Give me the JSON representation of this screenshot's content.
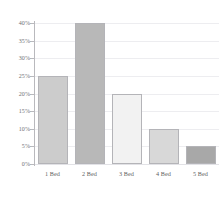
{
  "chart_data": {
    "type": "bar",
    "title": "",
    "subtitle": "",
    "xlabel": "",
    "ylabel": "",
    "categories": [
      "1 Bed",
      "2 Bed",
      "3 Bed",
      "4 Bed",
      "5 Bed"
    ],
    "values": [
      25,
      40,
      20,
      10,
      5
    ],
    "value_unit": "%",
    "ylim": [
      0,
      40
    ],
    "ytick_values": [
      0,
      5,
      10,
      15,
      20,
      25,
      30,
      35,
      40
    ],
    "ytick_labels": [
      "0%",
      "5%",
      "10%",
      "15%",
      "20%",
      "25%",
      "30%",
      "35%",
      "40%"
    ],
    "grid": true,
    "grid_axis": "y",
    "legend": false,
    "legend_position": "none",
    "bar_colors": [
      "#cccccc",
      "#b8b8b8",
      "#f2f2f2",
      "#d8d8d8",
      "#a8a8a8"
    ],
    "bar_border_color": "#b4b4b8",
    "gridline_color": "#ededf0",
    "axis_color": "#b9b9bd",
    "tick_label_color": "#6f6f73",
    "background_color": "#ffffff"
  }
}
